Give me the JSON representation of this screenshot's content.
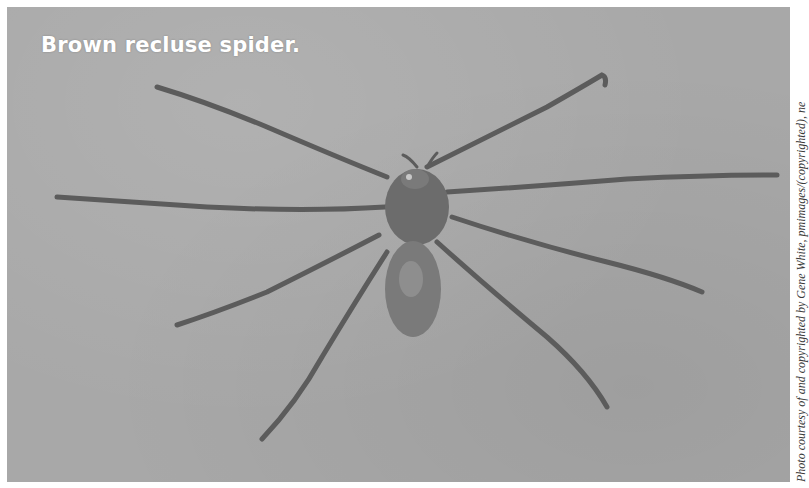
{
  "figure": {
    "title": "Brown recluse spider.",
    "credit": "Photo courtesy of and copyrighted by Gene White, pmimages/(copyrighted), ne",
    "colors": {
      "background": "#a8a8a8",
      "spider_body": "#6e6e6e",
      "spider_legs": "#5a5a5a",
      "title_text": "#ffffff",
      "credit_text": "#3a3a3a"
    }
  }
}
